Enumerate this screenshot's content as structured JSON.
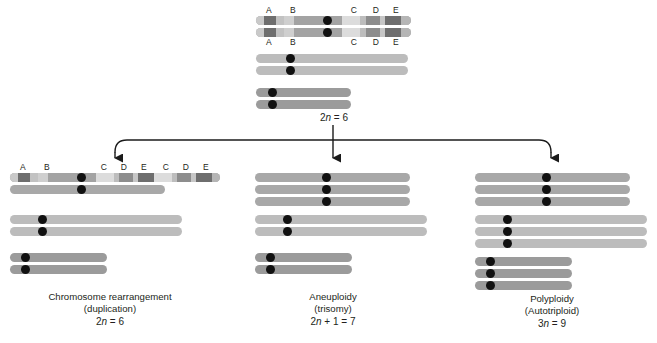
{
  "figure": {
    "background": "#ffffff"
  },
  "colors": {
    "chr1_base": "#a3a3a3",
    "chr2_base": "#b8b8b8",
    "chr3_base": "#9b9b9b",
    "band_light": "#c9c9c9",
    "band_mid": "#8d8d8d",
    "band_dark": "#6e6e6e",
    "band_pale": "#dcdcdc",
    "centromere": "#111111",
    "line": "#1b1b1b",
    "text": "#231f20"
  },
  "top": {
    "ploidy_label": "2n = 6",
    "ploidy_prefix": "2",
    "ploidy_italic": "n",
    "ploidy_suffix": " = 6",
    "labels_above": [
      "A",
      "B",
      "C",
      "D",
      "E"
    ],
    "labels_below": [
      "A",
      "B",
      "C",
      "D",
      "E"
    ]
  },
  "panels": [
    {
      "id": "rearrangement",
      "caption_line1": "Chromosome rearrangement",
      "caption_line2": "(duplication)",
      "ploidy_prefix": "2",
      "ploidy_italic": "n",
      "ploidy_suffix": " = 6",
      "ploidy_label": "2n = 6",
      "band_labels": [
        "A",
        "B",
        "C",
        "D",
        "E",
        "C",
        "D",
        "E"
      ],
      "chromosome_counts": {
        "chr1": 2,
        "chr2": 2,
        "chr3": 2
      },
      "note": "one homolog of chromosome 1 carries a duplicated C-D-E segment"
    },
    {
      "id": "aneuploidy",
      "caption_line1": "Aneuploidy",
      "caption_line2": "(trisomy)",
      "ploidy_prefix": "2",
      "ploidy_italic": "n",
      "ploidy_suffix": " + 1 = 7",
      "ploidy_label": "2n + 1 = 7",
      "band_labels": [],
      "chromosome_counts": {
        "chr1": 3,
        "chr2": 2,
        "chr3": 2
      },
      "note": "three copies of chromosome 1"
    },
    {
      "id": "polyploidy",
      "caption_line1": "Polyploidy",
      "caption_line2": "(Autotriploid)",
      "ploidy_prefix": "3",
      "ploidy_italic": "n",
      "ploidy_suffix": " = 9",
      "ploidy_label": "3n = 9",
      "band_labels": [],
      "chromosome_counts": {
        "chr1": 3,
        "chr2": 3,
        "chr3": 3
      },
      "note": "three copies of every chromosome"
    }
  ]
}
